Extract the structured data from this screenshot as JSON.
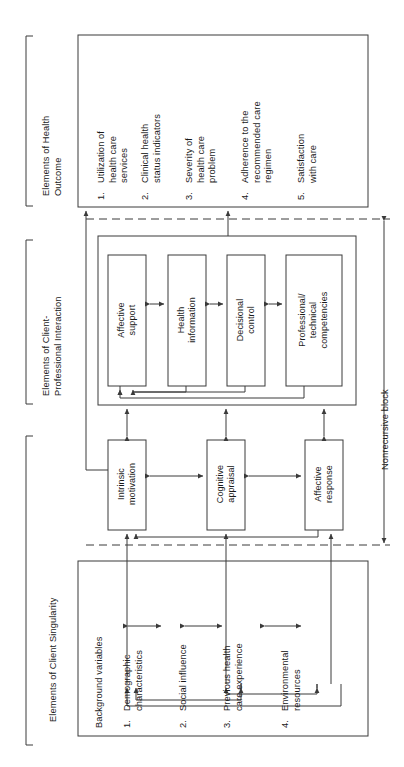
{
  "figure": {
    "type": "flowchart",
    "orientation": "rotated-90-ccw",
    "background": "#ffffff",
    "line_color": "#3a3a3a"
  },
  "brackets": [
    {
      "id": "health-outcome",
      "label": "Elements of Health\nOutcome"
    },
    {
      "id": "client-professional",
      "label": "Elements of Client-\nProfessional Interaction"
    },
    {
      "id": "client-singularity",
      "label": "Elements of Client Singularity"
    }
  ],
  "health_outcome": {
    "items": [
      {
        "num": "1.",
        "text": "Utilization of\nhealth care\nservices"
      },
      {
        "num": "2.",
        "text": "Clinical health\nstatus indicators"
      },
      {
        "num": "3.",
        "text": "Severity of\nhealth care\nproblem"
      },
      {
        "num": "4.",
        "text": "Adherence to the\nrecommended care\nregimen"
      },
      {
        "num": "5.",
        "text": "Satisfaction\nwith care"
      }
    ]
  },
  "interaction": {
    "boxes": [
      {
        "id": "affective-support",
        "text": "Affective\nsupport"
      },
      {
        "id": "health-information",
        "text": "Health\ninformation"
      },
      {
        "id": "decisional-control",
        "text": "Decisional\ncontrol"
      },
      {
        "id": "professional-competencies",
        "text": "Professional/\ntechnical\ncompetencies"
      }
    ]
  },
  "singularity": {
    "boxes": [
      {
        "id": "intrinsic-motivation",
        "text": "Intrinsic\nmotivation"
      },
      {
        "id": "cognitive-appraisal",
        "text": "Cognitive\nappraisal"
      },
      {
        "id": "affective-response",
        "text": "Affective\nresponse"
      }
    ]
  },
  "background_variables": {
    "title": "Background variables",
    "items": [
      {
        "num": "1.",
        "text": "Demographic\ncharacteristics"
      },
      {
        "num": "2.",
        "text": "Social influence"
      },
      {
        "num": "3.",
        "text": "Previous health\ncare experience"
      },
      {
        "num": "4.",
        "text": "Environmental\nresources"
      }
    ]
  },
  "annotations": {
    "nonrecursive_block": "Nonrecursive block"
  }
}
